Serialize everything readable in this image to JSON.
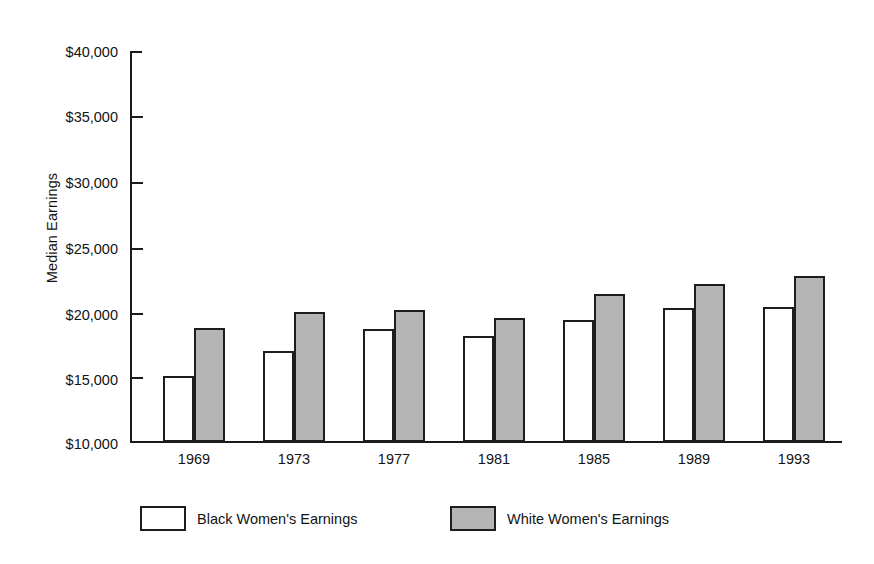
{
  "chart_data": {
    "type": "bar",
    "title": "",
    "subtitle": "",
    "xlabel": "",
    "ylabel": "Median Earnings",
    "categories": [
      "1969",
      "1973",
      "1977",
      "1981",
      "1985",
      "1989",
      "1993"
    ],
    "series": [
      {
        "name": "Black Women's Earnings",
        "fill": "#ffffff",
        "values": [
          15000,
          16900,
          18600,
          18100,
          19300,
          20200,
          20300
        ]
      },
      {
        "name": "White Women's Earnings",
        "fill": "#b5b5b5",
        "values": [
          18700,
          19900,
          20100,
          19500,
          21300,
          22100,
          22700
        ]
      }
    ],
    "ylim": [
      10000,
      40000
    ],
    "ytick_values": [
      40000,
      35000,
      30000,
      25000,
      20000,
      15000,
      10000
    ],
    "ytick_labels": [
      "$40,000",
      "$35,000",
      "$30,000",
      "$25,000",
      "$20,000",
      "$15,000",
      "$10,000"
    ],
    "grid": false,
    "legend_position": "bottom",
    "axis_color": "#1a1a1a",
    "bar_border_color": "#1d1d1d",
    "background": "#ffffff"
  },
  "legend": {
    "items": [
      {
        "label": "Black Women's Earnings",
        "swatch": "white-series-swatch"
      },
      {
        "label": "White Women's Earnings",
        "swatch": "gray-series-swatch"
      }
    ]
  }
}
